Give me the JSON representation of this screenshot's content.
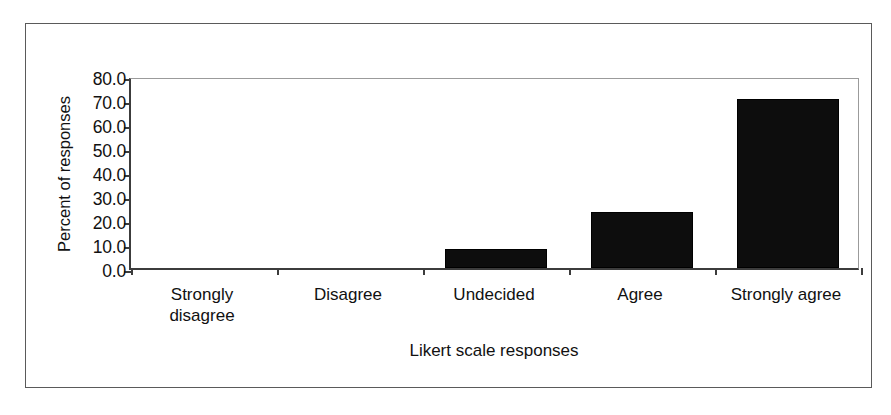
{
  "chart_data": {
    "type": "bar",
    "title": "",
    "xlabel": "Likert scale responses",
    "ylabel": "Percent of responses",
    "categories": [
      "Strongly disagree",
      "Disagree",
      "Undecided",
      "Agree",
      "Strongly agree"
    ],
    "category_lines": [
      [
        "Strongly",
        "disagree"
      ],
      [
        "Disagree"
      ],
      [
        "Undecided"
      ],
      [
        "Agree"
      ],
      [
        "Strongly agree"
      ]
    ],
    "values": [
      0.0,
      0.0,
      8.0,
      23.5,
      70.5
    ],
    "ylim": [
      0.0,
      80.0
    ],
    "ytick_labels": [
      "0.0",
      "10.0",
      "20.0",
      "30.0",
      "40.0",
      "50.0",
      "60.0",
      "70.0",
      "80.0"
    ],
    "ytick_values": [
      0,
      10,
      20,
      30,
      40,
      50,
      60,
      70,
      80
    ],
    "grid": false,
    "legend": "none",
    "bar_color": "#0d0d0d",
    "axis_color": "#3c3c3c",
    "frame_color": "#5a5a5a",
    "background_color": "#ffffff"
  }
}
